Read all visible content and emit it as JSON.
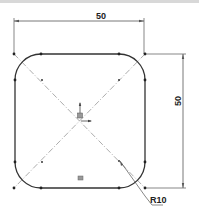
{
  "drawing": {
    "type": "sketch",
    "shape": "rounded-square",
    "dimensions": {
      "horizontal": {
        "label": "50"
      },
      "vertical": {
        "label": "50"
      },
      "radius": {
        "label": "R10"
      }
    },
    "colors": {
      "geometry": "#333333",
      "dimension": "#555555",
      "centerline": "#888888",
      "background": "#ffffff"
    }
  }
}
